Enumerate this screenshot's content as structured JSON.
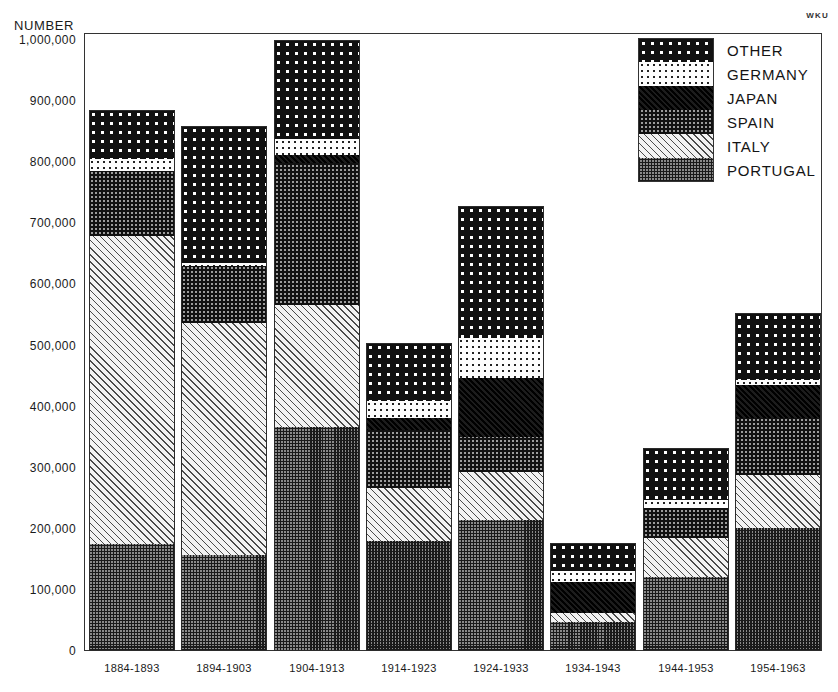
{
  "corner_mark": "WKU",
  "chart_data": {
    "type": "bar",
    "subtype": "stacked-bar",
    "title": "",
    "xlabel": "",
    "ylabel": "NUMBER",
    "ylim": [
      0,
      1000000
    ],
    "grid": false,
    "legend_position": "top-right",
    "y_ticks": [
      {
        "value": 1000000,
        "label": "1,000,000"
      },
      {
        "value": 900000,
        "label": "900,000"
      },
      {
        "value": 800000,
        "label": "800,000"
      },
      {
        "value": 700000,
        "label": "700,000"
      },
      {
        "value": 600000,
        "label": "600,000"
      },
      {
        "value": 500000,
        "label": "500,000"
      },
      {
        "value": 400000,
        "label": "400,000"
      },
      {
        "value": 300000,
        "label": "300,000"
      },
      {
        "value": 200000,
        "label": "200,000"
      },
      {
        "value": 100000,
        "label": "100,000"
      },
      {
        "value": 0,
        "label": "0"
      }
    ],
    "categories": [
      "1884-1893",
      "1894-1903",
      "1904-1913",
      "1914-1923",
      "1924-1933",
      "1934-1943",
      "1944-1953",
      "1954-1963"
    ],
    "series": [
      {
        "name": "PORTUGAL",
        "pattern": "checkerboard-dark",
        "values": [
          175000,
          157000,
          367000,
          180000,
          214000,
          47000,
          121000,
          201000
        ]
      },
      {
        "name": "ITALY",
        "pattern": "diagonal-hatch-light",
        "values": [
          505000,
          380000,
          200000,
          87000,
          79000,
          15000,
          64000,
          87000
        ]
      },
      {
        "name": "SPAIN",
        "pattern": "checkerboard-mid",
        "values": [
          105000,
          93000,
          232000,
          95000,
          57000,
          0,
          49000,
          93000
        ]
      },
      {
        "name": "JAPAN",
        "pattern": "solid-black",
        "values": [
          0,
          0,
          13000,
          19000,
          97000,
          51000,
          0,
          54000
        ]
      },
      {
        "name": "GERMANY",
        "pattern": "fine-dots-on-white",
        "values": [
          20000,
          5000,
          26000,
          28000,
          65000,
          18000,
          13000,
          8000
        ]
      },
      {
        "name": "OTHER",
        "pattern": "white-dots-on-black",
        "values": [
          80000,
          225000,
          162000,
          95000,
          217000,
          46000,
          85000,
          110000
        ]
      }
    ],
    "totals": [
      885000,
      860000,
      1000000,
      504000,
      729000,
      177000,
      332000,
      553000
    ]
  },
  "legend": {
    "entries": [
      {
        "label": "OTHER",
        "pattern": "other"
      },
      {
        "label": "GERMANY",
        "pattern": "germany"
      },
      {
        "label": "JAPAN",
        "pattern": "japan"
      },
      {
        "label": "SPAIN",
        "pattern": "spain"
      },
      {
        "label": "ITALY",
        "pattern": "italy"
      },
      {
        "label": "PORTUGAL",
        "pattern": "portugal"
      }
    ]
  }
}
